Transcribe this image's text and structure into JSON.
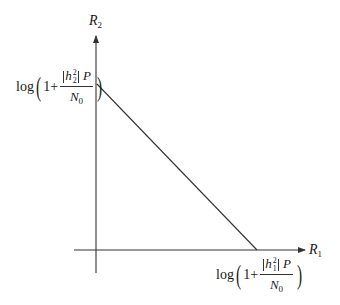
{
  "diagram": {
    "type": "capacity-region",
    "axes": {
      "x": {
        "label_var": "R",
        "label_sub": "1"
      },
      "y": {
        "label_var": "R",
        "label_sub": "2"
      }
    },
    "y_intercept": {
      "log": "log",
      "one_plus": "1+",
      "channel_var": "h",
      "channel_sup": "2",
      "channel_sub": "2",
      "power": "P",
      "noise_var": "N",
      "noise_sub": "0"
    },
    "x_intercept": {
      "log": "log",
      "one_plus": "1+",
      "channel_var": "h",
      "channel_sup": "2",
      "channel_sub": "1",
      "power": "P",
      "noise_var": "N",
      "noise_sub": "0"
    },
    "colors": {
      "stroke": "#333333",
      "text": "#1a1a1a",
      "background": "#ffffff"
    }
  }
}
